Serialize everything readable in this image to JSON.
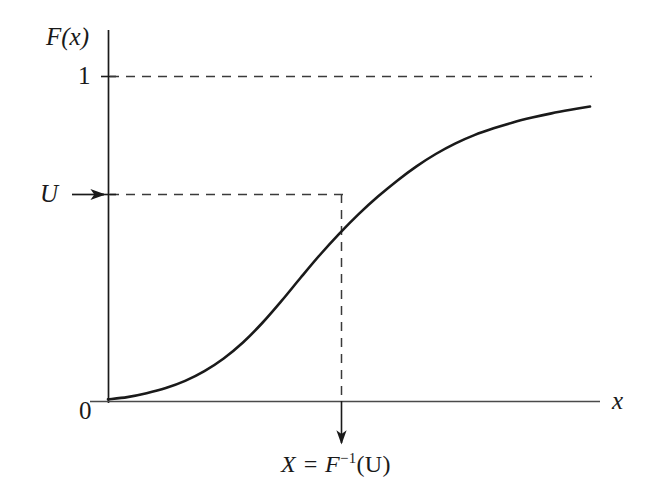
{
  "figure": {
    "name": "inverse-transform-sampling-cdf",
    "background_color": "#ffffff",
    "ink_color": "#1a1a1a",
    "labels": {
      "y_axis": "F(x)",
      "x_axis": "x",
      "y_tick_one": "1",
      "origin": "0",
      "uniform_level": "U",
      "inverse_value_prefix": "X = F",
      "inverse_value_exponent": "−1",
      "inverse_value_suffix": "(U)",
      "inverse_value_full": "X = F−1(U)"
    },
    "icons": {
      "u_arrow": "arrow-right-icon",
      "x_arrow": "arrow-down-icon"
    }
  },
  "chart_data": {
    "type": "line",
    "title": "",
    "xlabel": "x",
    "ylabel": "F(x)",
    "xlim": [
      0,
      1
    ],
    "ylim": [
      0,
      1.08
    ],
    "grid": false,
    "legend": null,
    "series": [
      {
        "name": "F(x)",
        "style": "solid",
        "x": [
          0.0,
          0.04,
          0.08,
          0.12,
          0.16,
          0.2,
          0.24,
          0.28,
          0.32,
          0.36,
          0.4,
          0.44,
          0.48,
          0.52,
          0.56,
          0.6,
          0.64,
          0.68,
          0.72,
          0.76,
          0.8,
          0.84,
          0.88,
          0.92,
          0.96,
          1.0
        ],
        "y": [
          0.005,
          0.012,
          0.024,
          0.04,
          0.062,
          0.092,
          0.131,
          0.18,
          0.24,
          0.308,
          0.38,
          0.45,
          0.515,
          0.575,
          0.629,
          0.678,
          0.722,
          0.76,
          0.792,
          0.818,
          0.839,
          0.857,
          0.872,
          0.885,
          0.896,
          0.906
        ]
      }
    ],
    "annotations": [
      {
        "name": "unit-level-dashed-line",
        "kind": "hline",
        "y": 1.0,
        "style": "dashed",
        "label": "1"
      },
      {
        "name": "u-level-dashed-line",
        "kind": "hline-segment",
        "y": 0.514,
        "x_from": 0.0,
        "x_to": 0.482,
        "style": "dashed",
        "label": "U"
      },
      {
        "name": "x-value-dashed-line",
        "kind": "vline-segment",
        "x": 0.482,
        "y_from": 0.0,
        "y_to": 0.514,
        "style": "dashed",
        "label": "X = F−1(U)"
      },
      {
        "name": "u-inbound-arrow",
        "kind": "arrow",
        "direction": "right",
        "at_y": 0.514
      },
      {
        "name": "x-outbound-arrow",
        "kind": "arrow",
        "direction": "down",
        "at_x": 0.482
      }
    ]
  },
  "geometry": {
    "axis_origin": {
      "x": 108,
      "y": 401
    },
    "y_axis_top": 30,
    "x_axis_right": 600,
    "unit_line_y": 76,
    "u_line_y": 194,
    "x_line_x": 341,
    "curve_end": {
      "x": 590,
      "y": 91
    }
  }
}
